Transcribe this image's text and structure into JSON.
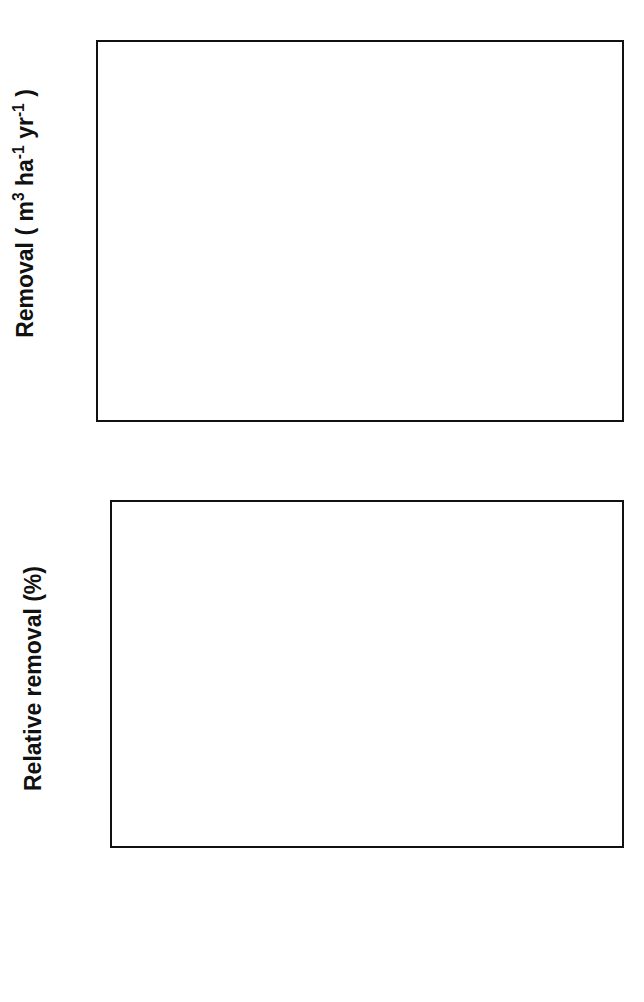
{
  "figure": {
    "background": "#ffffff",
    "series_colors": {
      "Total": "#ffffff",
      "Log": "#e0e0e0",
      "Pulp": "#636363",
      "Residue": "#111111"
    }
  },
  "legend": {
    "position": "bottom-center",
    "entries": [
      {
        "key": "total",
        "label": "Total",
        "color": "#ffffff"
      },
      {
        "key": "log",
        "label": "Log",
        "color": "#e0e0e0"
      },
      {
        "key": "pulp",
        "label": "Pulp",
        "color": "#636363"
      },
      {
        "key": "residue",
        "label": "Residue",
        "color": "#111111"
      }
    ]
  },
  "chart_data": [
    {
      "id": "removal-absolute",
      "type": "bar",
      "title": "",
      "xlabel": "",
      "ylabel": "Removal ( m3 ha-1 yr-1 )",
      "ylabel_display": "Removal ( m³ ha⁻¹ yr⁻¹ )",
      "ylim": [
        0,
        8
      ],
      "ytick_step": 1,
      "yticks": [
        0,
        1,
        2,
        3,
        4,
        5,
        6,
        7,
        8
      ],
      "ytick_labels": [
        "0",
        "1",
        "2",
        "3",
        "4",
        "5",
        "6",
        "7",
        "8"
      ],
      "gridlines": [
        1,
        2,
        3,
        4,
        5,
        6,
        7
      ],
      "grid": true,
      "categories": [
        "Current\nclimate",
        "Temp",
        "Pre",
        "Temp+\nPre",
        "CO2",
        "Temp+Pre\nCO2"
      ],
      "category_labels": [
        "Current\nclimate",
        "Temp",
        "Pre",
        "Temp+\nPre",
        "CO₂",
        "Temp+Pre\nCO₂"
      ],
      "series": [
        {
          "name": "Total",
          "values": [
            5.55,
            6.12,
            5.55,
            6.12,
            6.75,
            7.3
          ]
        },
        {
          "name": "Log",
          "values": [
            3.42,
            3.85,
            3.42,
            3.78,
            4.15,
            4.55
          ]
        },
        {
          "name": "Pulp",
          "values": [
            2.0,
            2.17,
            2.03,
            2.25,
            2.45,
            2.6
          ]
        },
        {
          "name": "Residue",
          "values": [
            0.08,
            0.08,
            0.08,
            0.09,
            0.12,
            0.13
          ]
        }
      ]
    },
    {
      "id": "removal-relative",
      "type": "bar",
      "title": "",
      "xlabel": "",
      "ylabel": "Relative removal (%)",
      "ylabel_display": "Relative removal (%)",
      "ylim": [
        95,
        135
      ],
      "ytick_step": 5,
      "yticks": [
        95,
        100,
        105,
        110,
        115,
        120,
        125,
        130,
        135
      ],
      "ytick_labels": [
        "95",
        "100",
        "105",
        "110",
        "115",
        "120",
        "125",
        "130",
        "135"
      ],
      "gridlines": [
        100,
        105,
        110,
        115,
        120,
        125,
        130
      ],
      "grid": true,
      "categories": [
        "Temp",
        "Pre",
        "Temp+\nPre",
        "CO2",
        "Temp+Pre\nCO2"
      ],
      "category_labels": [
        "Temp",
        "Pre",
        "Temp+\nPre",
        "CO₂",
        "Temp+Pre\nCO₂"
      ],
      "series": [
        {
          "name": "Total",
          "values": [
            110.0,
            100.0,
            110.0,
            120.8,
            130.5
          ]
        },
        {
          "name": "Log",
          "values": [
            111.5,
            100.0,
            110.0,
            120.4,
            131.8
          ]
        },
        {
          "name": "Pulp",
          "values": [
            106.9,
            100.1,
            110.0,
            121.5,
            128.6
          ]
        },
        {
          "name": "Residue",
          "values": [
            110.0,
            99.9,
            110.0,
            120.3,
            130.2
          ]
        }
      ]
    }
  ]
}
